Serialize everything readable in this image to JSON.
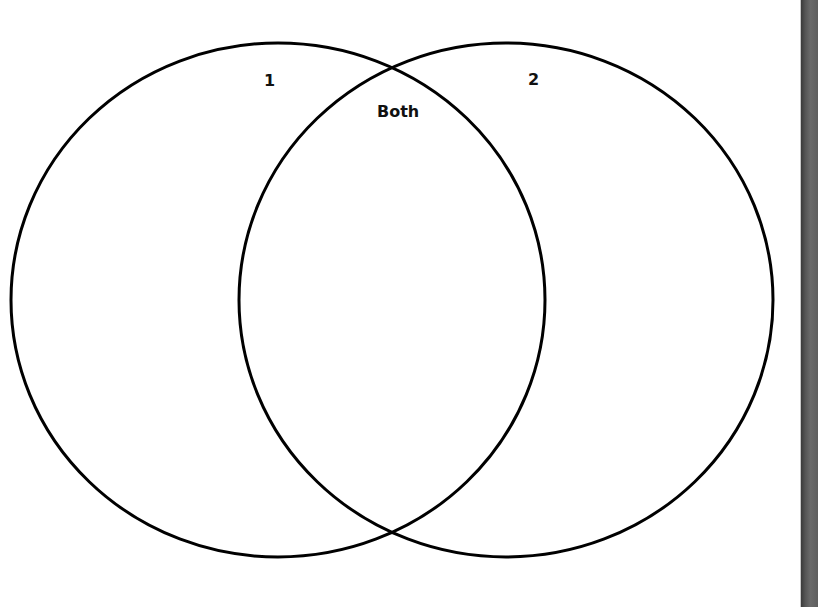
{
  "diagram": {
    "type": "venn",
    "sets": [
      {
        "label": "1",
        "cx": 278,
        "cy": 300,
        "rx": 267,
        "ry": 257
      },
      {
        "label": "2",
        "cx": 506,
        "cy": 300,
        "rx": 267,
        "ry": 257
      }
    ],
    "intersection_label": "Both",
    "stroke_color": "#000000",
    "background_color": "#ffffff"
  },
  "labels": {
    "set1": "1",
    "set2": "2",
    "both": "Both"
  },
  "edge": {
    "color": "#555555"
  }
}
